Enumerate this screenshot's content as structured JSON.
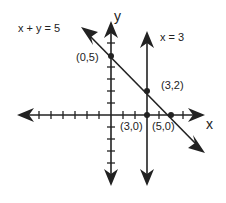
{
  "diagram": {
    "type": "coordinate-plane-graph",
    "axes": {
      "x_label": "x",
      "y_label": "y"
    },
    "lines": [
      {
        "equation": "x + y = 5",
        "label": "x + y = 5"
      },
      {
        "equation": "x = 3",
        "label": "x = 3"
      }
    ],
    "points": [
      {
        "label": "(0,5)",
        "x": 0,
        "y": 5
      },
      {
        "label": "(3,2)",
        "x": 3,
        "y": 2
      },
      {
        "label": "(3,0)",
        "x": 3,
        "y": 0
      },
      {
        "label": "(5,0)",
        "x": 5,
        "y": 0
      }
    ],
    "colors": {
      "ink": "#222222",
      "background": "#ffffff"
    }
  }
}
